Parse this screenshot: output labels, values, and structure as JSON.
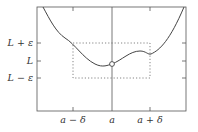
{
  "figure": {
    "type": "epsilon-delta limit diagram",
    "y_labels": {
      "upper": "L + ε",
      "mid": "L",
      "lower": "L − ε"
    },
    "x_labels": {
      "left": "a − δ",
      "mid": "a",
      "right": "a + δ"
    },
    "colors": {
      "frame": "#555555",
      "curve": "#444444",
      "dotted_box": "#666666",
      "text": "#333333"
    },
    "point": {
      "label": "(a, L)",
      "style": "open-circle"
    }
  }
}
